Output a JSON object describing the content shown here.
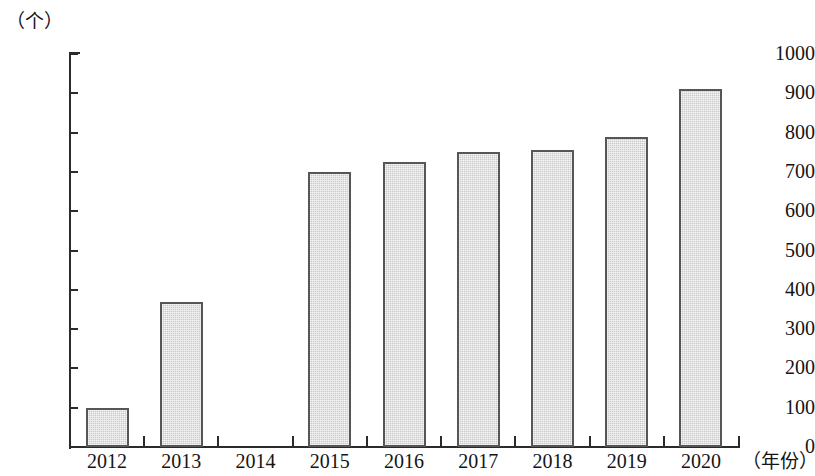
{
  "chart_data": {
    "type": "bar",
    "title": "",
    "subtitle": "",
    "xlabel": "（年份）",
    "ylabel": "（个）",
    "categories": [
      "2012",
      "2013",
      "2014",
      "2015",
      "2016",
      "2017",
      "2018",
      "2019",
      "2020"
    ],
    "values": [
      100,
      370,
      0,
      700,
      725,
      750,
      755,
      790,
      910
    ],
    "ylim": [
      0,
      1000
    ],
    "y_ticks": [
      0,
      100,
      200,
      300,
      400,
      500,
      600,
      700,
      800,
      900,
      1000
    ],
    "y_tick_labels": [
      "0",
      "100",
      "200",
      "300",
      "400",
      "500",
      "600",
      "700",
      "800",
      "900",
      "1000"
    ],
    "grid": false,
    "legend": null,
    "legend_position": "none",
    "colors": {
      "bar_fill": "#c9c9c9",
      "bar_border": "#565656",
      "axis": "#2b2b2b",
      "text": "#141414",
      "background": "#ffffff"
    }
  }
}
